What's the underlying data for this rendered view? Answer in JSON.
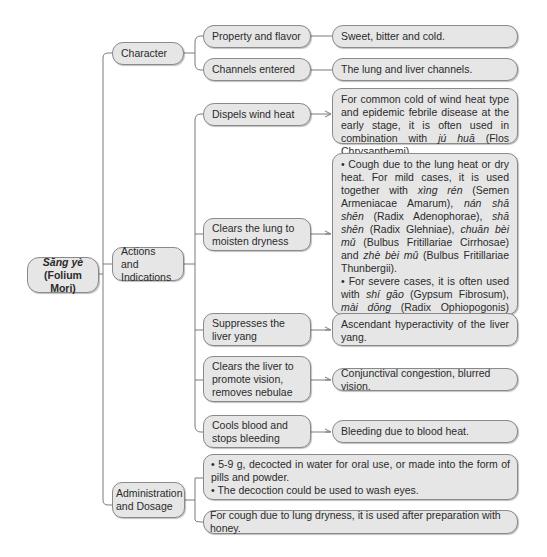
{
  "root": {
    "title_pinyin": "Sāng yè",
    "title_latin": "(Folium Mori)"
  },
  "branches": [
    {
      "label": "Character",
      "children": [
        {
          "label": "Property and flavor",
          "detail": "Sweet, bitter and cold."
        },
        {
          "label": "Channels entered",
          "detail": "The lung and liver channels."
        }
      ]
    },
    {
      "label": "Actions and Indications",
      "children": [
        {
          "label": "Dispels wind heat",
          "detail_parts": [
            "For common cold of wind heat type and epidemic febrile disease at the early stage, it is often used in combination with ",
            "jú huā",
            " (Flos Chrysanthemi)."
          ]
        },
        {
          "label": "Clears the lung to moisten dryness",
          "detail_bullet1_parts": [
            "• Cough due to the lung heat or dry heat. For mild cases, it is used together with ",
            "xìng rén",
            " (Semen Armeniacae Amarum), ",
            "nán shā shēn",
            " (Radix Adenophorae), ",
            "shā shēn",
            " (Radix Glehniae), ",
            "chuān bèi mǔ",
            " (Bulbus Fritillariae Cirrhosae) and ",
            "zhè bèi mǔ",
            " (Bulbus Fritillariae Thunbergii)."
          ],
          "detail_bullet2_parts": [
            "• For severe cases, it is often used with ",
            "shí gāo",
            " (Gypsum Fibrosum), ",
            "mài dōng",
            " (Radix Ophiopogonis) and ",
            "ē jiāo",
            " (Colla Corii Asini)."
          ]
        },
        {
          "label": "Suppresses the liver yang",
          "detail": "Ascendant hyperactivity of the liver yang."
        },
        {
          "label": "Clears the liver to promote vision, removes nebulae",
          "detail": "Conjunctival congestion, blurred vision."
        },
        {
          "label": "Cools blood and stops bleeding",
          "detail": "Bleeding due to blood heat."
        }
      ]
    },
    {
      "label": "Administration and Dosage",
      "children": [
        {
          "bullets": [
            "• 5-9 g, decocted in water for oral use, or made into the form of pills and powder.",
            "• The decoction could be used to wash eyes."
          ]
        },
        {
          "detail": "For cough due to lung dryness, it is used after preparation with honey."
        }
      ]
    }
  ],
  "colors": {
    "box_fill": "#e6e6e6",
    "box_border": "#8a8a8a",
    "line": "#7a7a7a",
    "text": "#2a2a2a"
  }
}
